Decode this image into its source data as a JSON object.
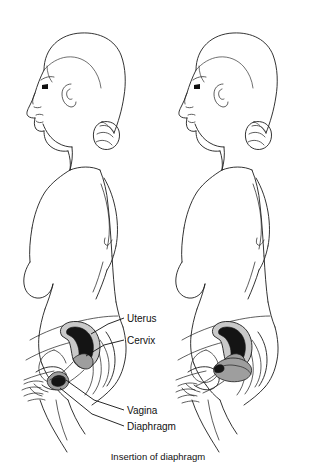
{
  "figure": {
    "caption": "Insertion of diaphragm",
    "title": "Insertion of diaphragm",
    "style": {
      "background_color": "#ffffff",
      "line_color": "#1d1d1d",
      "organ_fill_color": "#c9c9c9",
      "organ_cavity_color": "#141414",
      "diaphragm_fill_color": "#9e9e9e",
      "label_color": "#111111"
    },
    "panels": [
      {
        "name": "left-panel",
        "description": "Woman in profile, folding and inserting diaphragm",
        "stage": "insertion"
      },
      {
        "name": "right-panel",
        "description": "Woman in profile, diaphragm seated over cervix",
        "stage": "in-place"
      }
    ],
    "labels": [
      {
        "id": "uterus",
        "text": "Uterus",
        "x": 127,
        "y": 322
      },
      {
        "id": "cervix",
        "text": "Cervix",
        "x": 127,
        "y": 344
      },
      {
        "id": "vagina",
        "text": "Vagina",
        "x": 127,
        "y": 414
      },
      {
        "id": "diaphragm",
        "text": "Diaphragm",
        "x": 127,
        "y": 430
      }
    ]
  }
}
